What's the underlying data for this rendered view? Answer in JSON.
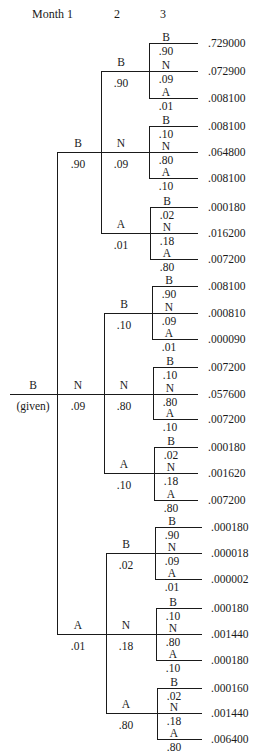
{
  "header": {
    "month1": "Month 1",
    "month2": "2",
    "month3": "3"
  },
  "root": {
    "state": "B",
    "note": "(given)"
  },
  "month1": [
    {
      "state": "B",
      "prob": ".90"
    },
    {
      "state": "N",
      "prob": ".09"
    },
    {
      "state": "A",
      "prob": ".01"
    }
  ],
  "month2": [
    {
      "state": "B",
      "prob": ".90"
    },
    {
      "state": "N",
      "prob": ".09"
    },
    {
      "state": "A",
      "prob": ".01"
    },
    {
      "state": "B",
      "prob": ".10"
    },
    {
      "state": "N",
      "prob": ".80"
    },
    {
      "state": "A",
      "prob": ".10"
    },
    {
      "state": "B",
      "prob": ".02"
    },
    {
      "state": "N",
      "prob": ".18"
    },
    {
      "state": "A",
      "prob": ".80"
    }
  ],
  "month3": [
    {
      "state": "B",
      "prob": ".90",
      "result": ".729000"
    },
    {
      "state": "N",
      "prob": ".09",
      "result": ".072900"
    },
    {
      "state": "A",
      "prob": ".01",
      "result": ".008100"
    },
    {
      "state": "B",
      "prob": ".10",
      "result": ".008100"
    },
    {
      "state": "N",
      "prob": ".80",
      "result": ".064800"
    },
    {
      "state": "A",
      "prob": ".10",
      "result": ".008100"
    },
    {
      "state": "B",
      "prob": ".02",
      "result": ".000180"
    },
    {
      "state": "N",
      "prob": ".18",
      "result": ".016200"
    },
    {
      "state": "A",
      "prob": ".80",
      "result": ".007200"
    },
    {
      "state": "B",
      "prob": ".90",
      "result": ".008100"
    },
    {
      "state": "N",
      "prob": ".09",
      "result": ".000810"
    },
    {
      "state": "A",
      "prob": ".01",
      "result": ".000090"
    },
    {
      "state": "B",
      "prob": ".10",
      "result": ".007200"
    },
    {
      "state": "N",
      "prob": ".80",
      "result": ".057600"
    },
    {
      "state": "A",
      "prob": ".10",
      "result": ".007200"
    },
    {
      "state": "B",
      "prob": ".02",
      "result": ".000180"
    },
    {
      "state": "N",
      "prob": ".18",
      "result": ".001620"
    },
    {
      "state": "A",
      "prob": ".80",
      "result": ".007200"
    },
    {
      "state": "B",
      "prob": ".90",
      "result": ".000180"
    },
    {
      "state": "N",
      "prob": ".09",
      "result": ".000018"
    },
    {
      "state": "A",
      "prob": ".01",
      "result": ".000002"
    },
    {
      "state": "B",
      "prob": ".10",
      "result": ".000180"
    },
    {
      "state": "N",
      "prob": ".80",
      "result": ".001440"
    },
    {
      "state": "A",
      "prob": ".10",
      "result": ".000180"
    },
    {
      "state": "B",
      "prob": ".02",
      "result": ".000160"
    },
    {
      "state": "N",
      "prob": ".18",
      "result": ".001440"
    },
    {
      "state": "A",
      "prob": ".80",
      "result": ".006400"
    }
  ]
}
